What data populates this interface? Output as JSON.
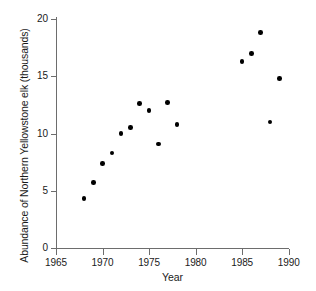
{
  "chart_data": {
    "type": "scatter",
    "title": "",
    "xlabel": "Year",
    "ylabel": "Abundance of Northern Yellowstone elk (thousands)",
    "xlim": [
      1965,
      1990
    ],
    "ylim": [
      0,
      20
    ],
    "xticks": [
      1965,
      1970,
      1975,
      1980,
      1985,
      1990
    ],
    "xtick_labels": [
      "1965",
      "1970",
      "1975",
      "1980",
      "1985",
      "1990"
    ],
    "yticks": [
      0,
      5,
      10,
      15,
      20
    ],
    "ytick_labels": [
      "0",
      "5",
      "10",
      "15",
      "20"
    ],
    "grid": false,
    "legend": false,
    "marker": "filled-circle",
    "marker_color": "#000000",
    "axis_color": "#6d6d6d",
    "series": [
      {
        "name": "Northern Yellowstone elk",
        "x": [
          1968,
          1969,
          1970,
          1971,
          1972,
          1973,
          1974,
          1975,
          1976,
          1977,
          1978,
          1985,
          1986,
          1987,
          1988,
          1989
        ],
        "y": [
          4.3,
          5.7,
          7.4,
          8.3,
          10.0,
          10.5,
          12.6,
          12.0,
          9.1,
          12.7,
          10.8,
          16.3,
          17.0,
          18.8,
          11.0,
          14.8
        ]
      }
    ]
  },
  "axes": {
    "y_title": "Abundance of Northern Yellowstone elk (thousands)",
    "x_title": "Year"
  }
}
